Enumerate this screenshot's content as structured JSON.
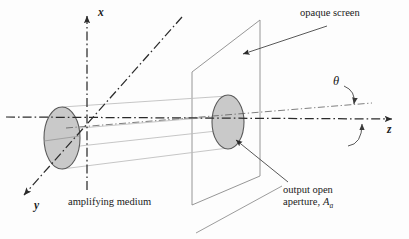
{
  "figure": {
    "caption_present": false,
    "background_color": "#fdfdfd",
    "axes": [
      {
        "name": "x",
        "label": "x",
        "direction": "up"
      },
      {
        "name": "y",
        "label": "y",
        "direction": "down-left"
      },
      {
        "name": "z",
        "label": "z",
        "direction": "right"
      }
    ],
    "labels": {
      "opaque_screen": "opaque screen",
      "amplifying_medium": "amplifying medium",
      "output_aperture_line1": "output open",
      "output_aperture_line2_text": "aperture,",
      "output_aperture_symbol": "A",
      "output_aperture_subscript": "a",
      "divergence_angle": "θ"
    },
    "colors": {
      "axis": "#2b2b2b",
      "aperture_fill": "#c9c9c9",
      "aperture_stroke": "#555555",
      "beam_line": "#b9b9b9",
      "screen_edge": "#8a8a8a",
      "leader_line": "#4a4a4a",
      "text": "#1a1a1a"
    },
    "elements": {
      "input_aperture_name": "amplifying-medium-aperture",
      "output_aperture_name": "output-open-aperture",
      "screen_name": "opaque-screen",
      "beam_name": "diverging-beam-cone"
    }
  }
}
